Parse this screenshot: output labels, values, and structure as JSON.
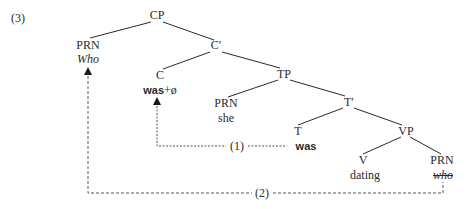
{
  "example_number": "(3)",
  "tree": {
    "nodes": {
      "CP": {
        "label": "CP"
      },
      "PRN_who": {
        "label": "PRN",
        "word": "Who"
      },
      "Cbar": {
        "label": "C′"
      },
      "C": {
        "label": "C",
        "word_bold": "was",
        "word_suffix": "+ø"
      },
      "TP": {
        "label": "TP"
      },
      "PRN_she": {
        "label": "PRN",
        "word": "she"
      },
      "Tbar": {
        "label": "T′"
      },
      "T": {
        "label": "T",
        "word": "was"
      },
      "VP": {
        "label": "VP"
      },
      "V": {
        "label": "V",
        "word": "dating"
      },
      "PRN_trace": {
        "label": "PRN",
        "word": "who"
      }
    },
    "movements": [
      {
        "label": "(1)",
        "from": "T",
        "to": "C"
      },
      {
        "label": "(2)",
        "from": "PRN_trace",
        "to": "PRN_who"
      }
    ]
  },
  "colors": {
    "ink": "#2a2a2a",
    "background": "#ffffff"
  }
}
